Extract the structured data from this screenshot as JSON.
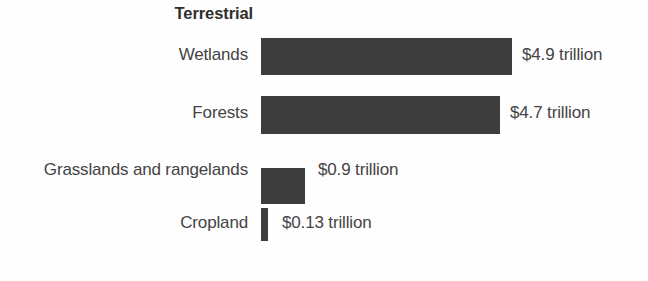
{
  "chart_data": {
    "type": "bar",
    "title": "Terrestrial",
    "orientation": "horizontal",
    "xlabel": "",
    "ylabel": "",
    "unit": "trillion USD",
    "grid": false,
    "legend": false,
    "axis_visible": false,
    "xlim": [
      0,
      5.0
    ],
    "categories": [
      "Wetlands",
      "Forests",
      "Grasslands and rangelands",
      "Cropland"
    ],
    "values": [
      4.9,
      4.7,
      0.9,
      0.13
    ],
    "value_labels": [
      "$4.9 trillion",
      "$4.7 trillion",
      "$0.9 trillion",
      "$0.13 trillion"
    ],
    "bar_color": "#3d3d3d",
    "background_color": "#fefefe",
    "text_color": "#444444"
  },
  "rows": [
    {
      "label": "Wetlands",
      "value_label": "$4.9 trillion",
      "value": 4.9
    },
    {
      "label": "Forests",
      "value_label": "$4.7 trillion",
      "value": 4.7
    },
    {
      "label": "Grasslands and rangelands",
      "value_label": "$0.9 trillion",
      "value": 0.9
    },
    {
      "label": "Cropland",
      "value_label": "$0.13 trillion",
      "value": 0.13
    }
  ],
  "layout": {
    "row_tops": [
      35,
      93,
      150,
      203
    ],
    "bar_tops": [
      3,
      3,
      18,
      5
    ],
    "bar_heights": [
      37,
      38,
      36,
      33
    ],
    "bar_widths": [
      251,
      239,
      44,
      7
    ],
    "label_gaps": [
      10,
      10,
      13,
      14
    ]
  }
}
